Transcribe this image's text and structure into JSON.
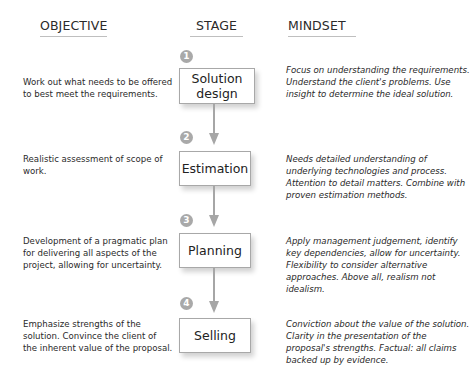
{
  "headers": {
    "objective": "OBJECTIVE",
    "stage": "STAGE",
    "mindset": "MINDSET"
  },
  "stages": [
    {
      "number": "1",
      "label": "Solution design",
      "objective": "Work out what needs to be offered to best meet the requirements.",
      "mindset": "Focus on understanding the requirements. Understand the client's problems. Use insight to determine the ideal solution."
    },
    {
      "number": "2",
      "label": "Estimation",
      "objective": "Realistic assessment of scope of work.",
      "mindset": "Needs detailed understanding of underlying technologies and process. Attention to detail matters. Combine with proven estimation methods."
    },
    {
      "number": "3",
      "label": "Planning",
      "objective": "Development of a pragmatic plan for delivering all aspects of the project, allowing for uncertainty.",
      "mindset": "Apply management judgement, identify key dependencies, allow for uncertainty. Flexibility to consider alternative approaches. Above all, realism not idealism."
    },
    {
      "number": "4",
      "label": "Selling",
      "objective": "Emphasize strengths of the solution. Convince the client of the inherent value of the proposal.",
      "mindset": "Conviction about the value of the solution. Clarity in the presentation of the proposal's strengths. Factual: all claims backed up by evidence."
    }
  ],
  "colors": {
    "arrow": "#a6a6a6",
    "badge": "#a9a9a9",
    "box_border": "#a8a8a8"
  }
}
